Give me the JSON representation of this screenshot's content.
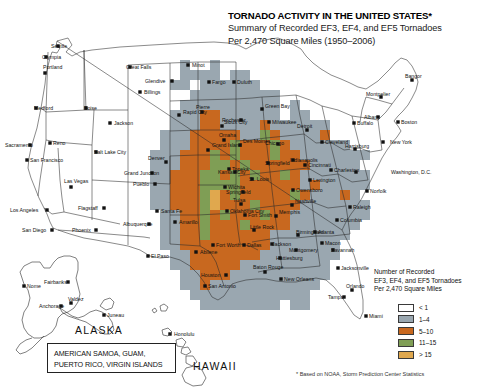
{
  "title": {
    "main": "TORNADO ACTIVITY IN THE UNITED STATES*",
    "sub1": "Summary of Recorded EF3, EF4, and EF5 Tornadoes",
    "sub2": "Per 2,470 Square Miles (1950–2006)"
  },
  "legend": {
    "title1": "Number of Recorded",
    "title2": "EF3, EF4, and EF5 Tornadoes",
    "title3": "Per 2,470 Square Miles",
    "items": [
      {
        "label": "< 1",
        "color": "#ffffff"
      },
      {
        "label": "1–4",
        "color": "#9aa7b0"
      },
      {
        "label": "5–10",
        "color": "#c8681f"
      },
      {
        "label": "11–15",
        "color": "#7f9e55"
      },
      {
        "label": "> 15",
        "color": "#e0a84e"
      }
    ]
  },
  "footnote": "* Based on NOAA, Storm Prediction Center Statistics",
  "territories": {
    "line1": "AMERICAN SAMOA, GUAM,",
    "line2": "PUERTO RICO, VIRGIN ISLANDS"
  },
  "regions": {
    "alaska": "ALASKA",
    "hawaii": "HAWAII"
  },
  "cities": [
    {
      "name": "Seattle",
      "x": 58,
      "y": 46,
      "mx": 51,
      "my": 48,
      "anchor": "start"
    },
    {
      "name": "Olympia",
      "x": 46,
      "y": 57,
      "mx": 42,
      "my": 59,
      "anchor": "start"
    },
    {
      "name": "Portland",
      "x": 45,
      "y": 73,
      "mx": 43,
      "my": 69,
      "anchor": "start"
    },
    {
      "name": "Medford",
      "x": 36,
      "y": 108,
      "mx": 34,
      "my": 110,
      "anchor": "start"
    },
    {
      "name": "Boise",
      "x": 86,
      "y": 108,
      "mx": 84,
      "my": 110,
      "anchor": "start"
    },
    {
      "name": "Sacramento",
      "x": 30,
      "y": 145,
      "mx": 5,
      "my": 147,
      "anchor": "start"
    },
    {
      "name": "Reno",
      "x": 50,
      "y": 143,
      "mx": 53,
      "my": 145,
      "anchor": "start"
    },
    {
      "name": "Salt Lake City",
      "x": 96,
      "y": 152,
      "mx": 94,
      "my": 154,
      "anchor": "start"
    },
    {
      "name": "San Francisco",
      "x": 27,
      "y": 160,
      "mx": 30,
      "my": 162,
      "anchor": "start"
    },
    {
      "name": "Las Vegas",
      "x": 71,
      "y": 187,
      "mx": 64,
      "my": 183,
      "anchor": "start"
    },
    {
      "name": "Los Angeles",
      "x": 47,
      "y": 210,
      "mx": 10,
      "my": 212,
      "anchor": "start"
    },
    {
      "name": "San Diego",
      "x": 52,
      "y": 230,
      "mx": 22,
      "my": 232,
      "anchor": "start"
    },
    {
      "name": "Flagstaff",
      "x": 104,
      "y": 208,
      "mx": 78,
      "my": 210,
      "anchor": "start"
    },
    {
      "name": "Phoenix",
      "x": 96,
      "y": 230,
      "mx": 72,
      "my": 232,
      "anchor": "start"
    },
    {
      "name": "Great Falls",
      "x": 130,
      "y": 67,
      "mx": 126,
      "my": 69,
      "anchor": "start"
    },
    {
      "name": "Minot",
      "x": 188,
      "y": 65,
      "mx": 192,
      "my": 67,
      "anchor": "start"
    },
    {
      "name": "Glendive",
      "x": 172,
      "y": 81,
      "mx": 145,
      "my": 83,
      "anchor": "start"
    },
    {
      "name": "Billings",
      "x": 140,
      "y": 92,
      "mx": 144,
      "my": 94,
      "anchor": "start"
    },
    {
      "name": "Fargo",
      "x": 209,
      "y": 82,
      "mx": 212,
      "my": 84,
      "anchor": "start"
    },
    {
      "name": "Duluth",
      "x": 234,
      "y": 82,
      "mx": 237,
      "my": 84,
      "anchor": "start"
    },
    {
      "name": "Jackson",
      "x": 110,
      "y": 123,
      "mx": 114,
      "my": 125,
      "anchor": "start"
    },
    {
      "name": "Rapid City",
      "x": 179,
      "y": 115,
      "mx": 183,
      "my": 114,
      "anchor": "start"
    },
    {
      "name": "Pierre",
      "x": 202,
      "y": 112,
      "mx": 196,
      "my": 109,
      "anchor": "start"
    },
    {
      "name": "Grand Island",
      "x": 208,
      "y": 150,
      "mx": 212,
      "my": 147,
      "anchor": "start"
    },
    {
      "name": "Omaha",
      "x": 224,
      "y": 140,
      "mx": 219,
      "my": 137,
      "anchor": "start"
    },
    {
      "name": "Sioux City",
      "x": 222,
      "y": 126,
      "mx": 224,
      "my": 124,
      "anchor": "start"
    },
    {
      "name": "Denver",
      "x": 166,
      "y": 162,
      "mx": 148,
      "my": 160,
      "anchor": "start"
    },
    {
      "name": "Grand Junction",
      "x": 152,
      "y": 173,
      "mx": 124,
      "my": 175,
      "anchor": "start"
    },
    {
      "name": "Pueblo",
      "x": 155,
      "y": 184,
      "mx": 133,
      "my": 186,
      "anchor": "start"
    },
    {
      "name": "Topeka",
      "x": 229,
      "y": 169,
      "mx": 232,
      "my": 171,
      "anchor": "start"
    },
    {
      "name": "Wichita",
      "x": 225,
      "y": 187,
      "mx": 228,
      "my": 189,
      "anchor": "start"
    },
    {
      "name": "Tulsa",
      "x": 241,
      "y": 204,
      "mx": 233,
      "my": 202,
      "anchor": "start"
    },
    {
      "name": "Oklahoma City",
      "x": 227,
      "y": 211,
      "mx": 230,
      "my": 213,
      "anchor": "start"
    },
    {
      "name": "Santa Fe",
      "x": 157,
      "y": 211,
      "mx": 161,
      "my": 213,
      "anchor": "start"
    },
    {
      "name": "Albuquerque",
      "x": 149,
      "y": 224,
      "mx": 123,
      "my": 226,
      "anchor": "start"
    },
    {
      "name": "Amarillo",
      "x": 175,
      "y": 222,
      "mx": 179,
      "my": 224,
      "anchor": "start"
    },
    {
      "name": "Abilene",
      "x": 196,
      "y": 252,
      "mx": 200,
      "my": 254,
      "anchor": "start"
    },
    {
      "name": "El Paso",
      "x": 148,
      "y": 256,
      "mx": 151,
      "my": 258,
      "anchor": "start"
    },
    {
      "name": "Fort Worth",
      "x": 213,
      "y": 245,
      "mx": 216,
      "my": 247,
      "anchor": "start"
    },
    {
      "name": "Dallas",
      "x": 244,
      "y": 245,
      "mx": 247,
      "my": 247,
      "anchor": "start"
    },
    {
      "name": "Houston",
      "x": 226,
      "y": 275,
      "mx": 201,
      "my": 277,
      "anchor": "start"
    },
    {
      "name": "San Antonio",
      "x": 205,
      "y": 286,
      "mx": 208,
      "my": 288,
      "anchor": "start"
    },
    {
      "name": "Green Bay",
      "x": 262,
      "y": 109,
      "mx": 265,
      "my": 108,
      "anchor": "start"
    },
    {
      "name": "Milwaukee",
      "x": 269,
      "y": 122,
      "mx": 272,
      "my": 124,
      "anchor": "start"
    },
    {
      "name": "Rochester",
      "x": 241,
      "y": 120,
      "mx": 222,
      "my": 122,
      "anchor": "start"
    },
    {
      "name": "Detroit",
      "x": 307,
      "y": 130,
      "mx": 297,
      "my": 128,
      "anchor": "start"
    },
    {
      "name": "Cleveland",
      "x": 322,
      "y": 142,
      "mx": 325,
      "my": 144,
      "anchor": "start"
    },
    {
      "name": "Des Moines",
      "x": 240,
      "y": 145,
      "mx": 243,
      "my": 143,
      "anchor": "start"
    },
    {
      "name": "Chicago",
      "x": 278,
      "y": 144,
      "mx": 265,
      "my": 145,
      "anchor": "start"
    },
    {
      "name": "Indianapolis",
      "x": 293,
      "y": 160,
      "mx": 290,
      "my": 162,
      "anchor": "start"
    },
    {
      "name": "Springfield",
      "x": 268,
      "y": 163,
      "mx": 265,
      "my": 165,
      "anchor": "start"
    },
    {
      "name": "Cincinnati",
      "x": 305,
      "y": 165,
      "mx": 308,
      "my": 167,
      "anchor": "start"
    },
    {
      "name": "Kansas City",
      "x": 235,
      "y": 172,
      "mx": 218,
      "my": 174,
      "anchor": "start"
    },
    {
      "name": "St. Louis",
      "x": 252,
      "y": 179,
      "mx": 249,
      "my": 181,
      "anchor": "start"
    },
    {
      "name": "Springfield",
      "x": 243,
      "y": 192,
      "mx": 226,
      "my": 194,
      "anchor": "start"
    },
    {
      "name": "Lexington",
      "x": 310,
      "y": 180,
      "mx": 313,
      "my": 182,
      "anchor": "start"
    },
    {
      "name": "Owensboro",
      "x": 293,
      "y": 190,
      "mx": 296,
      "my": 192,
      "anchor": "start"
    },
    {
      "name": "Charleston",
      "x": 331,
      "y": 170,
      "mx": 334,
      "my": 172,
      "anchor": "start"
    },
    {
      "name": "Nashville",
      "x": 292,
      "y": 205,
      "mx": 295,
      "my": 203,
      "anchor": "start"
    },
    {
      "name": "Memphis",
      "x": 276,
      "y": 216,
      "mx": 279,
      "my": 214,
      "anchor": "start"
    },
    {
      "name": "Fort Smith",
      "x": 245,
      "y": 215,
      "mx": 248,
      "my": 217,
      "anchor": "start"
    },
    {
      "name": "Little Rock",
      "x": 254,
      "y": 230,
      "mx": 250,
      "my": 229,
      "anchor": "start"
    },
    {
      "name": "Birmingham",
      "x": 298,
      "y": 235,
      "mx": 296,
      "my": 234,
      "anchor": "start"
    },
    {
      "name": "Jackson",
      "x": 272,
      "y": 244,
      "mx": 272,
      "my": 246,
      "anchor": "start"
    },
    {
      "name": "Montgomery",
      "x": 296,
      "y": 250,
      "mx": 289,
      "my": 252,
      "anchor": "start"
    },
    {
      "name": "Hattiesburg",
      "x": 280,
      "y": 258,
      "mx": 276,
      "my": 260,
      "anchor": "start"
    },
    {
      "name": "Baton Rouge",
      "x": 265,
      "y": 272,
      "mx": 253,
      "my": 269,
      "anchor": "start"
    },
    {
      "name": "New Orleans",
      "x": 281,
      "y": 279,
      "mx": 284,
      "my": 281,
      "anchor": "start"
    },
    {
      "name": "Atlanta",
      "x": 315,
      "y": 232,
      "mx": 318,
      "my": 234,
      "anchor": "start"
    },
    {
      "name": "Macon",
      "x": 322,
      "y": 243,
      "mx": 325,
      "my": 245,
      "anchor": "start"
    },
    {
      "name": "Savannah",
      "x": 333,
      "y": 250,
      "mx": 331,
      "my": 252,
      "anchor": "start"
    },
    {
      "name": "Columbia",
      "x": 337,
      "y": 220,
      "mx": 340,
      "my": 222,
      "anchor": "start"
    },
    {
      "name": "Jacksonville",
      "x": 338,
      "y": 268,
      "mx": 341,
      "my": 270,
      "anchor": "start"
    },
    {
      "name": "Orlando",
      "x": 352,
      "y": 290,
      "mx": 346,
      "my": 288,
      "anchor": "start"
    },
    {
      "name": "Tampa",
      "x": 344,
      "y": 297,
      "mx": 328,
      "my": 299,
      "anchor": "start"
    },
    {
      "name": "Miami",
      "x": 366,
      "y": 316,
      "mx": 369,
      "my": 318,
      "anchor": "start"
    },
    {
      "name": "Raleigh",
      "x": 350,
      "y": 207,
      "mx": 353,
      "my": 209,
      "anchor": "start"
    },
    {
      "name": "Norfolk",
      "x": 367,
      "y": 191,
      "mx": 370,
      "my": 193,
      "anchor": "start"
    },
    {
      "name": "Washington, D.C.",
      "x": 356,
      "y": 172,
      "mx": 391,
      "my": 174,
      "anchor": "start"
    },
    {
      "name": "Harrisburg",
      "x": 355,
      "y": 149,
      "mx": 345,
      "my": 148,
      "anchor": "start"
    },
    {
      "name": "Buffalo",
      "x": 354,
      "y": 123,
      "mx": 357,
      "my": 125,
      "anchor": "start"
    },
    {
      "name": "New York",
      "x": 383,
      "y": 142,
      "mx": 390,
      "my": 144,
      "anchor": "start"
    },
    {
      "name": "Albany",
      "x": 378,
      "y": 117,
      "mx": 364,
      "my": 119,
      "anchor": "start"
    },
    {
      "name": "Boston",
      "x": 398,
      "y": 122,
      "mx": 401,
      "my": 124,
      "anchor": "start"
    },
    {
      "name": "Montpelier",
      "x": 381,
      "y": 97,
      "mx": 366,
      "my": 96,
      "anchor": "start"
    },
    {
      "name": "Bangor",
      "x": 412,
      "y": 80,
      "mx": 405,
      "my": 78,
      "anchor": "start"
    },
    {
      "name": "Nome",
      "x": 24,
      "y": 286,
      "mx": 27,
      "my": 288,
      "anchor": "start"
    },
    {
      "name": "Fairbanks",
      "x": 68,
      "y": 282,
      "mx": 44,
      "my": 284,
      "anchor": "start"
    },
    {
      "name": "Anchorage",
      "x": 61,
      "y": 306,
      "mx": 39,
      "my": 308,
      "anchor": "start"
    },
    {
      "name": "Valdez",
      "x": 71,
      "y": 303,
      "mx": 68,
      "my": 301,
      "anchor": "start"
    },
    {
      "name": "Juneau",
      "x": 104,
      "y": 315,
      "mx": 107,
      "my": 317,
      "anchor": "start"
    },
    {
      "name": "Honolulu",
      "x": 170,
      "y": 334,
      "mx": 174,
      "my": 336,
      "anchor": "start"
    }
  ],
  "chart_data": {
    "type": "heatmap",
    "title": "TORNADO ACTIVITY IN THE UNITED STATES*",
    "subtitle": "Summary of Recorded EF3, EF4, and EF5 Tornadoes Per 2,470 Square Miles (1950–2006)",
    "unit": "tornadoes per 2,470 square miles",
    "period": "1950–2006",
    "source": "* Based on NOAA, Storm Prediction Center Statistics",
    "bins": [
      {
        "label": "< 1",
        "color": "#ffffff",
        "min": 0,
        "max": 1
      },
      {
        "label": "1–4",
        "color": "#9aa7b0",
        "min": 1,
        "max": 4
      },
      {
        "label": "5–10",
        "color": "#c8681f",
        "min": 5,
        "max": 10
      },
      {
        "label": "11–15",
        "color": "#7f9e55",
        "min": 11,
        "max": 15
      },
      {
        "label": "> 15",
        "color": "#e0a84e",
        "min": 15,
        "max": null
      }
    ],
    "grid": {
      "cell_px": 10,
      "origin_x": 130,
      "origin_y": 60,
      "cols": 29,
      "rows": 25,
      "note": "Row strings index bins: 0=<1 (white), 1=1-4 (gray), 2=5-10 (orange), 3=11-15 (green), 4=>15 (tan); '.' = no data / outside country",
      "rows_data": [
        ".....1..1....................",
        ".....1111.11.................",
        "....11.111111................",
        "......111111111..............",
        ".....1111111111.1............",
        "....11122111111.11...........",
        "....1112211112111111.........",
        "...11122222113211112.........",
        "...1112222322232111111.......",
        "..1112223232223221111111.....",
        "..111222332322222211111......",
        "..1122233232322321111111.....",
        "..1122233332222221211111.....",
        "..112223423222223211121......",
        "..1122234222322221111111.....",
        "...112232322232211111111.....",
        "...11223222322221111111......",
        "...1122322222211111111.......",
        "...112222222221111111........",
        "....11222222211111111........",
        "....1122222111111111.........",
        ".....112221111111111.........",
        ".....11211111111111..........",
        "......111111111111...........",
        ".......11111111.11..........."
      ]
    },
    "hotspot_regions": [
      {
        "name": "Oklahoma / Kansas Tornado Alley",
        "level": "> 15"
      },
      {
        "name": "North Texas",
        "level": "11–15"
      },
      {
        "name": "Mississippi / Alabama Dixie Alley",
        "level": "11–15"
      },
      {
        "name": "Iowa / Illinois / Indiana",
        "level": "5–10"
      },
      {
        "name": "Western United States",
        "level": "< 1"
      }
    ]
  }
}
